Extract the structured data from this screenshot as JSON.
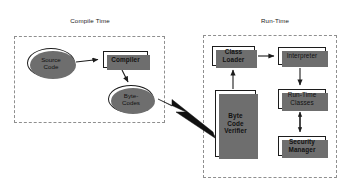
{
  "diagram": {
    "title_compile": "Compile Time",
    "title_runtime": "Run-Time",
    "colors": {
      "stroke": "#1c1c1c",
      "shadow": "#6e6e6e",
      "dashed": "#8f8f8f",
      "background": "#ffffff",
      "text": "#111111"
    },
    "nodes": {
      "source_code": {
        "label": "Source\nCode",
        "shape": "ellipse"
      },
      "compiler": {
        "label": "Compiler",
        "shape": "box"
      },
      "byte_codes": {
        "label": "Byte-\nCodes",
        "shape": "ellipse"
      },
      "class_loader": {
        "label": "Class\nLoader",
        "shape": "box"
      },
      "interpreter": {
        "label": "Interpreter",
        "shape": "box"
      },
      "byte_code_verifier": {
        "label": "Byte\nCode\nVerifier",
        "shape": "box"
      },
      "runtime_classes": {
        "label": "Run-Time\nClasses",
        "shape": "box"
      },
      "security_manager": {
        "label": "Security\nManager",
        "shape": "box"
      }
    },
    "edges": [
      {
        "name": "source-code-to-compiler",
        "from": "source_code",
        "to": "compiler",
        "style": "thin-arrow"
      },
      {
        "name": "compiler-to-byte-codes",
        "from": "compiler",
        "to": "byte_codes",
        "style": "thin-arrow"
      },
      {
        "name": "byte-codes-to-verifier",
        "from": "byte_code_verifier",
        "to": "byte_codes",
        "style": "thick-arrow"
      },
      {
        "name": "verifier-to-class-loader",
        "from": "byte_code_verifier",
        "to": "class_loader",
        "style": "thin-arrow"
      },
      {
        "name": "class-loader-to-interpreter",
        "from": "class_loader",
        "to": "interpreter",
        "style": "thin-arrow"
      },
      {
        "name": "interpreter-to-runtime-classes",
        "from": "interpreter",
        "to": "runtime_classes",
        "style": "thin-arrow"
      },
      {
        "name": "runtime-classes-to-security-manager",
        "from": "runtime_classes",
        "to": "security_manager",
        "style": "double-arrow"
      }
    ]
  }
}
